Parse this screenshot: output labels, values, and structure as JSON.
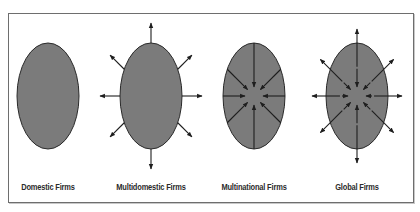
{
  "figure": {
    "panels": [
      {
        "id": "domestic",
        "label": "Domestic Firms",
        "cx": 48,
        "arrows": "none"
      },
      {
        "id": "multidomestic",
        "label": "Multidomestic Firms",
        "cx": 151,
        "arrows": "outward"
      },
      {
        "id": "multinational",
        "label": "Multinational Firms",
        "cx": 254,
        "arrows": "inward"
      },
      {
        "id": "global",
        "label": "Global Firms",
        "cx": 357,
        "arrows": "both"
      }
    ],
    "ellipse": {
      "cy": 96,
      "rx": 31,
      "ry": 53
    },
    "colors": {
      "fill": "#7b7b7b",
      "stroke": "#2a2a2a",
      "arrow": "#1e1e1e",
      "border": "#6e6e6e"
    }
  }
}
